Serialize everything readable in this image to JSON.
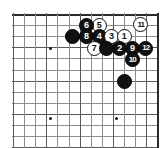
{
  "figure": {
    "name": "go-board-diagram",
    "board": {
      "columns": 14,
      "rows": 13,
      "cell_size": 11.1,
      "origin_x": 13,
      "origin_y": 14,
      "line_color": "#8d8d8d",
      "edge_color": "#2b2b2b",
      "background": "#ffffff"
    },
    "star_points": [
      {
        "name": "star-point-upper-left",
        "col": 3.35,
        "row": 3.05
      },
      {
        "name": "star-point-lower-left",
        "col": 3.35,
        "row": 9.35
      },
      {
        "name": "star-point-lower-right",
        "col": 9.3,
        "row": 9.35
      }
    ],
    "stones": [
      {
        "name": "stone-white-5",
        "label": "5",
        "color": "white",
        "col": 7.75,
        "row": 1.0
      },
      {
        "name": "stone-black-6",
        "label": "6",
        "color": "black",
        "col": 6.6,
        "row": 1.0
      },
      {
        "name": "stone-white-11",
        "label": "11",
        "color": "white",
        "col": 11.5,
        "row": 0.95
      },
      {
        "name": "stone-black-plain-a",
        "label": "",
        "color": "black",
        "col": 5.4,
        "row": 2.05
      },
      {
        "name": "stone-black-8",
        "label": "8",
        "color": "black",
        "col": 6.6,
        "row": 2.05
      },
      {
        "name": "stone-black-4",
        "label": "4",
        "color": "black",
        "col": 7.75,
        "row": 2.05
      },
      {
        "name": "stone-white-3",
        "label": "3",
        "color": "white",
        "col": 8.85,
        "row": 2.05
      },
      {
        "name": "stone-white-1",
        "label": "1",
        "color": "white",
        "col": 10.0,
        "row": 2.05
      },
      {
        "name": "stone-white-7",
        "label": "7",
        "color": "white",
        "col": 7.3,
        "row": 3.1
      },
      {
        "name": "stone-black-plain-b",
        "label": "",
        "color": "black",
        "col": 8.45,
        "row": 3.1
      },
      {
        "name": "stone-black-2",
        "label": "2",
        "color": "black",
        "col": 9.6,
        "row": 3.1
      },
      {
        "name": "stone-black-9",
        "label": "9",
        "color": "black",
        "col": 10.75,
        "row": 3.1
      },
      {
        "name": "stone-black-12",
        "label": "12",
        "color": "black",
        "col": 11.95,
        "row": 3.1
      },
      {
        "name": "stone-black-10",
        "label": "10",
        "color": "black",
        "col": 10.75,
        "row": 4.1
      },
      {
        "name": "stone-black-plain-c",
        "label": "",
        "color": "black",
        "col": 10.0,
        "row": 6.1
      }
    ]
  }
}
